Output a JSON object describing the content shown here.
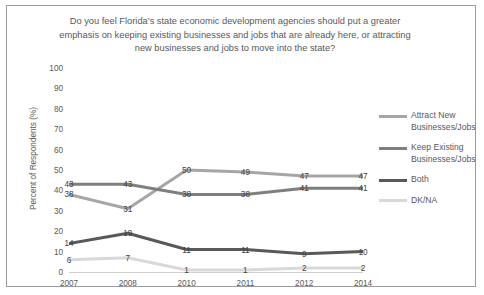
{
  "chart_data": {
    "type": "line",
    "title": "Do you feel Florida’s state economic development agencies should put a greater emphasis on keeping existing businesses and jobs that are already here, or attracting new businesses and jobs to move into the state?",
    "xlabel": "",
    "ylabel": "Percent of Respondents (%)",
    "ylim": [
      0,
      100
    ],
    "ytick_labels": [
      "100",
      "90",
      "80",
      "70",
      "60",
      "50",
      "40",
      "30",
      "20",
      "10",
      "0"
    ],
    "yticks": [
      100,
      90,
      80,
      70,
      60,
      50,
      40,
      30,
      20,
      10,
      0
    ],
    "grid": false,
    "legend_position": "right",
    "categories": [
      "2007",
      "2008",
      "2010",
      "2011",
      "2012",
      "2014"
    ],
    "series": [
      {
        "name": "Attract New Businesses/Jobs",
        "color": "#A6A6A6",
        "values": [
          38,
          31,
          50,
          49,
          47,
          47
        ]
      },
      {
        "name": "Keep Existing Businesses/Jobs",
        "color": "#7F7F7F",
        "values": [
          43,
          43,
          38,
          38,
          41,
          41
        ]
      },
      {
        "name": "Both",
        "color": "#595959",
        "values": [
          14,
          19,
          11,
          11,
          9,
          10
        ]
      },
      {
        "name": "DK/NA",
        "color": "#D9D9D9",
        "values": [
          6,
          7,
          1,
          1,
          2,
          2
        ]
      }
    ]
  }
}
